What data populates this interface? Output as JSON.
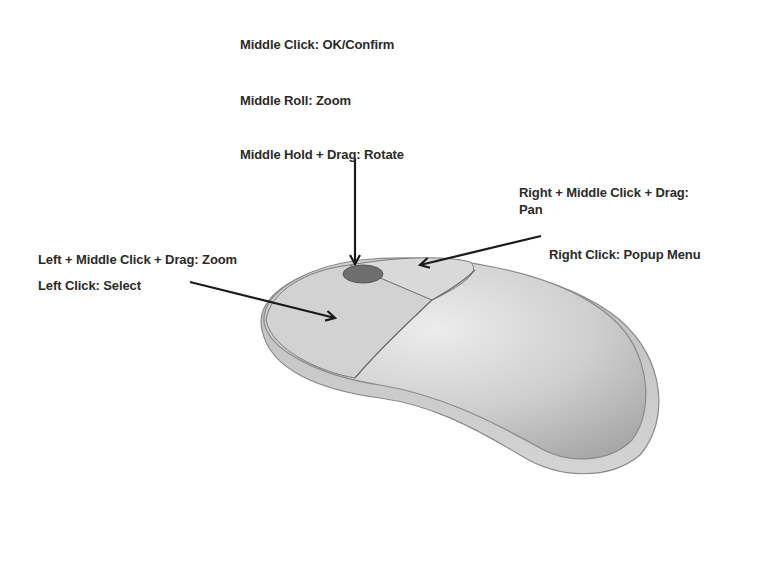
{
  "diagram": {
    "labels": {
      "middle_click": "Middle Click: OK/Confirm",
      "middle_roll": "Middle Roll: Zoom",
      "middle_hold_drag": "Middle Hold + Drag: Rotate",
      "right_middle_drag_line1": "Right + Middle Click + Drag:",
      "right_middle_drag_line2": "Pan",
      "right_click": "Right Click: Popup  Menu",
      "left_middle_drag": "Left + Middle Click + Drag: Zoom",
      "left_click": "Left Click: Select"
    },
    "colors": {
      "text": "#2a2a2a",
      "arrow": "#1a1a1a",
      "mouse_body": "#c8c8c8",
      "mouse_highlight": "#e6e6e6",
      "scroll_wheel": "#6e6e6e"
    }
  }
}
